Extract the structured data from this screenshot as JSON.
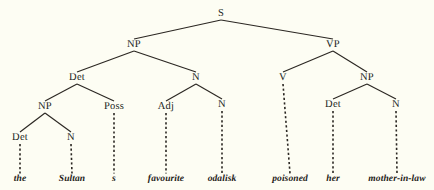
{
  "diagram": {
    "type": "syntax-tree",
    "title": "",
    "sentence": "the Sultan s favourite odalisk poisoned her mother-in-law",
    "colors": {
      "background": "#fdfdf3",
      "ink": "#211f1c",
      "line": "#2b2722"
    },
    "nodes": [
      {
        "id": "s",
        "label": "S",
        "x": 221,
        "y": 14
      },
      {
        "id": "np1",
        "label": "NP",
        "x": 134,
        "y": 45
      },
      {
        "id": "vp",
        "label": "VP",
        "x": 333,
        "y": 45
      },
      {
        "id": "det1",
        "label": "Det",
        "x": 77,
        "y": 78
      },
      {
        "id": "n1",
        "label": "N",
        "x": 196,
        "y": 78
      },
      {
        "id": "v",
        "label": "V",
        "x": 283,
        "y": 78
      },
      {
        "id": "np3",
        "label": "NP",
        "x": 367,
        "y": 78
      },
      {
        "id": "np2",
        "label": "NP",
        "x": 45,
        "y": 107
      },
      {
        "id": "poss",
        "label": "Poss",
        "x": 114,
        "y": 107
      },
      {
        "id": "adj",
        "label": "Adj",
        "x": 166,
        "y": 107
      },
      {
        "id": "n2",
        "label": "N",
        "x": 222,
        "y": 105
      },
      {
        "id": "det3",
        "label": "Det",
        "x": 333,
        "y": 105
      },
      {
        "id": "n3",
        "label": "N",
        "x": 396,
        "y": 105
      },
      {
        "id": "det2",
        "label": "Det",
        "x": 20,
        "y": 138
      },
      {
        "id": "n4",
        "label": "N",
        "x": 71,
        "y": 138
      }
    ],
    "terminals": [
      {
        "id": "w-the",
        "label": "the",
        "x": 20,
        "y": 180,
        "parent": "det2"
      },
      {
        "id": "w-sultan",
        "label": "Sultan",
        "x": 72,
        "y": 180,
        "parent": "n4"
      },
      {
        "id": "w-s",
        "label": "s",
        "x": 114,
        "y": 180,
        "parent": "poss"
      },
      {
        "id": "w-fav",
        "label": "favourite",
        "x": 166,
        "y": 180,
        "parent": "adj"
      },
      {
        "id": "w-odalisk",
        "label": "odalisk",
        "x": 222,
        "y": 180,
        "parent": "n2"
      },
      {
        "id": "w-poisoned",
        "label": "poisoned",
        "x": 290,
        "y": 180,
        "parent": "v"
      },
      {
        "id": "w-her",
        "label": "her",
        "x": 333,
        "y": 180,
        "parent": "det3"
      },
      {
        "id": "w-mil",
        "label": "mother-in-law",
        "x": 397,
        "y": 180,
        "parent": "n3"
      }
    ],
    "branches": [
      {
        "from": "s",
        "to": "np1",
        "style": "solid"
      },
      {
        "from": "s",
        "to": "vp",
        "style": "solid"
      },
      {
        "from": "np1",
        "to": "det1",
        "style": "solid"
      },
      {
        "from": "np1",
        "to": "n1",
        "style": "solid"
      },
      {
        "from": "vp",
        "to": "v",
        "style": "solid"
      },
      {
        "from": "vp",
        "to": "np3",
        "style": "solid"
      },
      {
        "from": "det1",
        "to": "np2",
        "style": "solid"
      },
      {
        "from": "det1",
        "to": "poss",
        "style": "solid"
      },
      {
        "from": "n1",
        "to": "adj",
        "style": "solid"
      },
      {
        "from": "n1",
        "to": "n2",
        "style": "solid"
      },
      {
        "from": "np3",
        "to": "det3",
        "style": "solid"
      },
      {
        "from": "np3",
        "to": "n3",
        "style": "solid"
      },
      {
        "from": "np2",
        "to": "det2",
        "style": "solid"
      },
      {
        "from": "np2",
        "to": "n4",
        "style": "solid"
      },
      {
        "from": "det2",
        "to": "w-the",
        "style": "dashed"
      },
      {
        "from": "n4",
        "to": "w-sultan",
        "style": "dashed"
      },
      {
        "from": "poss",
        "to": "w-s",
        "style": "dashed"
      },
      {
        "from": "adj",
        "to": "w-fav",
        "style": "dashed"
      },
      {
        "from": "n2",
        "to": "w-odalisk",
        "style": "dashed"
      },
      {
        "from": "v",
        "to": "w-poisoned",
        "style": "dashed"
      },
      {
        "from": "det3",
        "to": "w-her",
        "style": "dashed"
      },
      {
        "from": "n3",
        "to": "w-mil",
        "style": "dashed"
      }
    ]
  }
}
